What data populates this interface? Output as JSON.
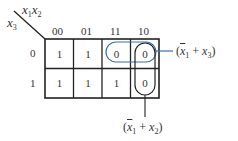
{
  "kmap": {
    "row_variable": "x",
    "row_variable_sub": "3",
    "col_variable_1": "x",
    "col_variable_1_sub": "1",
    "col_variable_2": "x",
    "col_variable_2_sub": "2",
    "col_headers": [
      "00",
      "01",
      "11",
      "10"
    ],
    "row_headers": [
      "0",
      "1"
    ],
    "cells": [
      [
        "1",
        "1",
        "0",
        "0"
      ],
      [
        "1",
        "1",
        "1",
        "0"
      ]
    ]
  },
  "groups": {
    "horizontal": {
      "open": "(",
      "var1": "x",
      "var1_sub": "1",
      "op": " + ",
      "var2": "x",
      "var2_sub": "3",
      "close": ")",
      "color": "#3a6fb5"
    },
    "vertical": {
      "open": "(",
      "var1": "x",
      "var1_sub": "1",
      "op": " + ",
      "var2": "x",
      "var2_sub": "2",
      "close": ")",
      "color": "#222222"
    }
  }
}
